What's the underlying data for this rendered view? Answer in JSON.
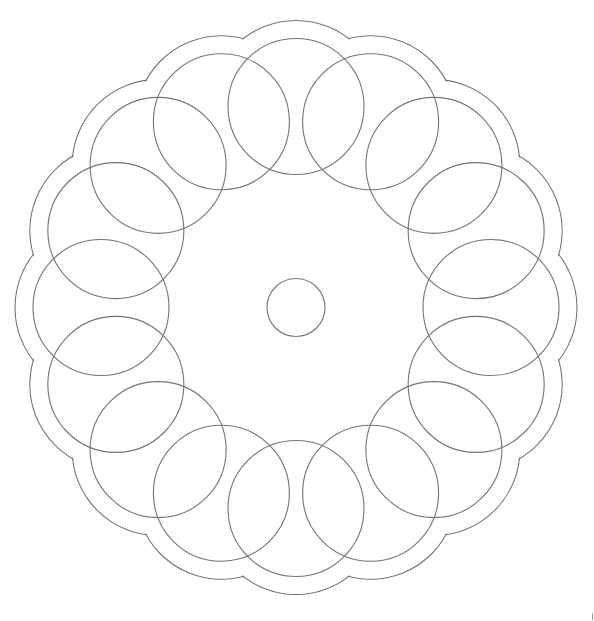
{
  "chart_data": {
    "type": "diagram",
    "title": "",
    "canvas": {
      "width": 594,
      "height": 621,
      "background": "#ffffff"
    },
    "line_color": "#747474",
    "center": {
      "x": 296,
      "y": 307.5
    },
    "center_circle": {
      "r": 29
    },
    "ring": {
      "count": 16,
      "radius_x": 195,
      "radius_y": 201,
      "start_angle_deg": -90,
      "circle_r": 68
    },
    "scallop_outline": {
      "count": 16,
      "circle_r": 86
    }
  }
}
